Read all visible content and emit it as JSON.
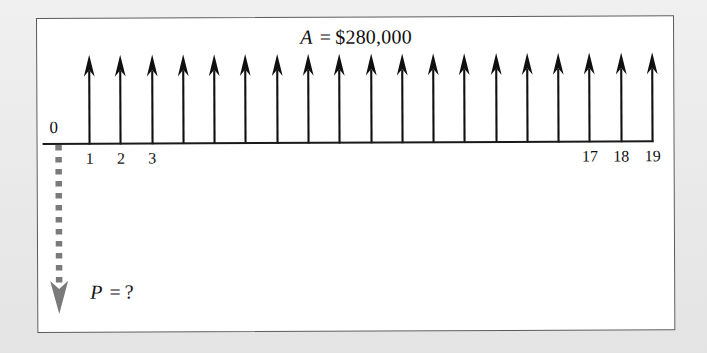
{
  "figure": {
    "type": "cash-flow-diagram",
    "annuity": {
      "symbol": "A",
      "equals": "=",
      "value": "$280,000",
      "full_text": "A = $280,000"
    },
    "present_worth": {
      "symbol": "P",
      "equals": "=",
      "value": "?",
      "full_text": "P = ?"
    },
    "axis": {
      "origin_label": "0",
      "left_tick_labels": [
        "1",
        "2",
        "3"
      ],
      "right_tick_labels": [
        "17",
        "18",
        "19"
      ],
      "first_period": 1,
      "last_period": 19,
      "period_count": 19
    },
    "colors": {
      "ink": "#101010",
      "frame": "#5a5a5a",
      "page": "#eaeaea",
      "figure_background": "#ffffff",
      "present_arrow": "#7a7a7a"
    }
  },
  "chart_data": {
    "type": "bar",
    "xlabel": "",
    "ylabel": "",
    "categories": [
      "0",
      "1",
      "2",
      "3",
      "4",
      "5",
      "6",
      "7",
      "8",
      "9",
      "10",
      "11",
      "12",
      "13",
      "14",
      "15",
      "16",
      "17",
      "18",
      "19"
    ],
    "values": [
      -1,
      280000,
      280000,
      280000,
      280000,
      280000,
      280000,
      280000,
      280000,
      280000,
      280000,
      280000,
      280000,
      280000,
      280000,
      280000,
      280000,
      280000,
      280000,
      280000
    ],
    "visible_tick_labels": [
      "0",
      "1",
      "2",
      "3",
      "17",
      "18",
      "19"
    ],
    "annotations": [
      "A = $280,000",
      "P = ?"
    ],
    "grid": false,
    "legend": null
  }
}
